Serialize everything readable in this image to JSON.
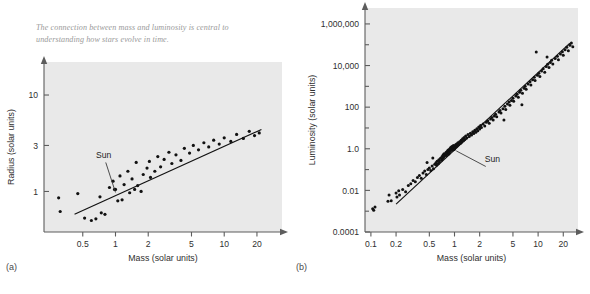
{
  "figure": {
    "caption": "The connection between mass and luminosity is central to understanding how stars evolve in time.",
    "background_color": "#ffffff",
    "plot_background_color": "#e9e9e9",
    "ink_color": "#111111",
    "axis_color": "#5d5d5d",
    "caption_color": "#9a9a9a"
  },
  "panels": {
    "a": {
      "label": "(a)"
    },
    "b": {
      "label": "(b)"
    }
  },
  "chart_data": [
    {
      "id": "radius-vs-mass",
      "panel": "(a)",
      "type": "scatter",
      "title": "",
      "xlabel": "Mass (solar units)",
      "ylabel": "Radius (solar units)",
      "xscale": "log",
      "yscale": "log",
      "xlim": [
        0.22,
        34
      ],
      "ylim": [
        0.38,
        22
      ],
      "grid": false,
      "legend": null,
      "xticks": [
        0.5,
        1,
        2,
        5,
        10,
        20
      ],
      "xticklabels": [
        "0.5",
        "1",
        "2",
        "5",
        "10",
        "20"
      ],
      "yticks": [
        1,
        3,
        10
      ],
      "yticklabels": [
        "1",
        "3",
        "10"
      ],
      "annotations": [
        {
          "text": "Sun",
          "x": 0.78,
          "y": 2.2,
          "points_to_x": 1.0,
          "points_to_y": 1.05
        }
      ],
      "fit_line": {
        "x": [
          0.42,
          22
        ],
        "y": [
          0.58,
          4.4
        ]
      },
      "points": [
        [
          0.3,
          0.86
        ],
        [
          0.31,
          0.62
        ],
        [
          0.45,
          0.95
        ],
        [
          0.52,
          0.53
        ],
        [
          0.6,
          0.5
        ],
        [
          0.66,
          0.52
        ],
        [
          0.72,
          0.88
        ],
        [
          0.74,
          0.6
        ],
        [
          0.8,
          0.58
        ],
        [
          0.88,
          1.1
        ],
        [
          0.95,
          1.28
        ],
        [
          0.98,
          1.05
        ],
        [
          1.0,
          1.05
        ],
        [
          1.05,
          0.8
        ],
        [
          1.1,
          1.45
        ],
        [
          1.15,
          0.82
        ],
        [
          1.2,
          1.18
        ],
        [
          1.3,
          1.62
        ],
        [
          1.35,
          0.97
        ],
        [
          1.42,
          1.35
        ],
        [
          1.5,
          1.05
        ],
        [
          1.55,
          2.0
        ],
        [
          1.6,
          1.15
        ],
        [
          1.72,
          1.0
        ],
        [
          1.8,
          1.5
        ],
        [
          1.95,
          1.75
        ],
        [
          2.05,
          2.05
        ],
        [
          2.1,
          1.4
        ],
        [
          2.3,
          1.62
        ],
        [
          2.45,
          2.3
        ],
        [
          2.6,
          1.8
        ],
        [
          2.8,
          2.15
        ],
        [
          3.1,
          2.55
        ],
        [
          3.3,
          1.95
        ],
        [
          3.6,
          2.4
        ],
        [
          4.0,
          2.1
        ],
        [
          4.3,
          2.8
        ],
        [
          4.8,
          2.5
        ],
        [
          5.2,
          3.0
        ],
        [
          5.8,
          2.7
        ],
        [
          6.5,
          3.2
        ],
        [
          7.2,
          2.9
        ],
        [
          8.0,
          3.4
        ],
        [
          9.0,
          3.1
        ],
        [
          10.0,
          3.6
        ],
        [
          11.5,
          3.3
        ],
        [
          13.0,
          3.9
        ],
        [
          15.0,
          3.55
        ],
        [
          17.0,
          4.2
        ],
        [
          19.0,
          3.8
        ],
        [
          21.0,
          4.05
        ]
      ]
    },
    {
      "id": "luminosity-vs-mass",
      "panel": "(b)",
      "type": "scatter",
      "title": "",
      "xlabel": "Mass (solar units)",
      "ylabel": "Luminosity (solar units)",
      "xscale": "log",
      "yscale": "log",
      "xlim": [
        0.085,
        30
      ],
      "ylim": [
        0.0001,
        3000000
      ],
      "grid": false,
      "legend": null,
      "xticks": [
        0.1,
        0.2,
        0.5,
        1,
        2,
        5,
        10,
        20
      ],
      "xticklabels": [
        "0.1",
        "0.2",
        "0.5",
        "1",
        "2",
        "5",
        "10",
        "20"
      ],
      "yticks": [
        0.0001,
        0.01,
        1.0,
        100,
        10000,
        1000000
      ],
      "yticklabels": [
        "0.0001",
        "0.01",
        "1.0",
        "100",
        "10,000",
        "1,000,000"
      ],
      "annotations": [
        {
          "text": "Sun",
          "x": 2.3,
          "y": 0.22,
          "points_to_x": 1.05,
          "points_to_y": 1.1
        }
      ],
      "fit_line": {
        "x": [
          0.2,
          24
        ],
        "y": [
          0.0022,
          120000
        ]
      },
      "points": [
        [
          0.105,
          0.0013
        ],
        [
          0.108,
          0.0011
        ],
        [
          0.112,
          0.0016
        ],
        [
          0.16,
          0.003
        ],
        [
          0.165,
          0.006
        ],
        [
          0.175,
          0.0032
        ],
        [
          0.2,
          0.0075
        ],
        [
          0.205,
          0.0048
        ],
        [
          0.215,
          0.0095
        ],
        [
          0.22,
          0.006
        ],
        [
          0.24,
          0.011
        ],
        [
          0.26,
          0.0085
        ],
        [
          0.28,
          0.017
        ],
        [
          0.3,
          0.021
        ],
        [
          0.32,
          0.03
        ],
        [
          0.34,
          0.026
        ],
        [
          0.36,
          0.042
        ],
        [
          0.38,
          0.052
        ],
        [
          0.4,
          0.038
        ],
        [
          0.42,
          0.068
        ],
        [
          0.44,
          0.085
        ],
        [
          0.46,
          0.058
        ],
        [
          0.48,
          0.1
        ],
        [
          0.5,
          0.12
        ],
        [
          0.52,
          0.09
        ],
        [
          0.54,
          0.15
        ],
        [
          0.56,
          0.11
        ],
        [
          0.58,
          0.18
        ],
        [
          0.6,
          0.21
        ],
        [
          0.61,
          0.16
        ],
        [
          0.62,
          0.25
        ],
        [
          0.64,
          0.19
        ],
        [
          0.65,
          0.3
        ],
        [
          0.66,
          0.23
        ],
        [
          0.68,
          0.35
        ],
        [
          0.7,
          0.28
        ],
        [
          0.71,
          0.42
        ],
        [
          0.72,
          0.33
        ],
        [
          0.73,
          0.5
        ],
        [
          0.74,
          0.38
        ],
        [
          0.75,
          0.58
        ],
        [
          0.76,
          0.45
        ],
        [
          0.78,
          0.52
        ],
        [
          0.79,
          0.66
        ],
        [
          0.8,
          0.48
        ],
        [
          0.81,
          0.72
        ],
        [
          0.82,
          0.6
        ],
        [
          0.83,
          0.82
        ],
        [
          0.84,
          0.55
        ],
        [
          0.85,
          0.9
        ],
        [
          0.86,
          0.7
        ],
        [
          0.87,
          0.62
        ],
        [
          0.88,
          1.0
        ],
        [
          0.89,
          0.78
        ],
        [
          0.9,
          1.15
        ],
        [
          0.91,
          0.85
        ],
        [
          0.92,
          0.95
        ],
        [
          0.93,
          1.3
        ],
        [
          0.94,
          1.05
        ],
        [
          0.95,
          0.88
        ],
        [
          0.96,
          1.2
        ],
        [
          0.97,
          1.45
        ],
        [
          0.98,
          1.1
        ],
        [
          0.99,
          0.92
        ],
        [
          1.0,
          1.0
        ],
        [
          1.01,
          1.35
        ],
        [
          1.02,
          1.18
        ],
        [
          1.03,
          1.55
        ],
        [
          1.05,
          1.25
        ],
        [
          1.06,
          1.7
        ],
        [
          1.08,
          1.4
        ],
        [
          1.1,
          1.95
        ],
        [
          1.12,
          1.6
        ],
        [
          1.15,
          2.2
        ],
        [
          1.18,
          1.85
        ],
        [
          1.2,
          2.6
        ],
        [
          1.22,
          2.1
        ],
        [
          1.25,
          3.0
        ],
        [
          1.28,
          2.45
        ],
        [
          1.3,
          3.5
        ],
        [
          1.33,
          2.8
        ],
        [
          1.36,
          4.1
        ],
        [
          1.4,
          3.3
        ],
        [
          1.45,
          4.8
        ],
        [
          1.5,
          3.9
        ],
        [
          1.55,
          5.6
        ],
        [
          1.6,
          4.6
        ],
        [
          1.65,
          6.5
        ],
        [
          1.7,
          5.4
        ],
        [
          1.75,
          7.8
        ],
        [
          1.8,
          6.2
        ],
        [
          1.85,
          9.2
        ],
        [
          1.9,
          7.4
        ],
        [
          1.95,
          11.0
        ],
        [
          2.0,
          8.8
        ],
        [
          2.05,
          13.0
        ],
        [
          2.1,
          10.5
        ],
        [
          2.2,
          15.5
        ],
        [
          2.3,
          12.5
        ],
        [
          2.4,
          19.0
        ],
        [
          2.5,
          22.0
        ],
        [
          2.6,
          17.0
        ],
        [
          2.7,
          27.0
        ],
        [
          2.8,
          32.0
        ],
        [
          2.9,
          24.0
        ],
        [
          3.0,
          38.0
        ],
        [
          3.1,
          46.0
        ],
        [
          3.2,
          35.0
        ],
        [
          3.4,
          58.0
        ],
        [
          3.5,
          70.0
        ],
        [
          3.6,
          52.0
        ],
        [
          3.8,
          85.0
        ],
        [
          4.0,
          110.0
        ],
        [
          4.1,
          78.0
        ],
        [
          4.3,
          140.0
        ],
        [
          4.5,
          175.0
        ],
        [
          4.6,
          125.0
        ],
        [
          4.8,
          210.0
        ],
        [
          5.0,
          270.0
        ],
        [
          5.1,
          190.0
        ],
        [
          5.4,
          340.0
        ],
        [
          5.6,
          420.0
        ],
        [
          5.8,
          300.0
        ],
        [
          6.0,
          520.0
        ],
        [
          6.2,
          650.0
        ],
        [
          6.5,
          470.0
        ],
        [
          6.8,
          800.0
        ],
        [
          7.0,
          1000.0
        ],
        [
          7.2,
          720.0
        ],
        [
          7.6,
          1300.0
        ],
        [
          8.0,
          1650.0
        ],
        [
          8.2,
          1150.0
        ],
        [
          8.6,
          2100.0
        ],
        [
          9.0,
          2700.0
        ],
        [
          9.2,
          1900.0
        ],
        [
          9.8,
          3400.0
        ],
        [
          10.2,
          4300.0
        ],
        [
          10.5,
          3000.0
        ],
        [
          11.0,
          5500.0
        ],
        [
          11.5,
          7000.0
        ],
        [
          12.0,
          4800.0
        ],
        [
          12.5,
          9000.0
        ],
        [
          13.0,
          11500.0
        ],
        [
          13.5,
          8000.0
        ],
        [
          14.0,
          14000.0
        ],
        [
          14.5,
          18000.0
        ],
        [
          15.0,
          12000.0
        ],
        [
          16.0,
          22000.0
        ],
        [
          17.0,
          28000.0
        ],
        [
          17.5,
          19000.0
        ],
        [
          18.5,
          36000.0
        ],
        [
          19.5,
          46000.0
        ],
        [
          20.0,
          31000.0
        ],
        [
          21.0,
          58000.0
        ],
        [
          22.0,
          75000.0
        ],
        [
          23.0,
          52000.0
        ],
        [
          24.0,
          95000.0
        ],
        [
          25.0,
          120000.0
        ],
        [
          26.0,
          80000.0
        ],
        [
          9.5,
          45000.0
        ],
        [
          12.8,
          26000.0
        ],
        [
          6.4,
          130.0
        ],
        [
          3.9,
          24.0
        ],
        [
          0.55,
          0.36
        ],
        [
          0.47,
          0.22
        ]
      ]
    }
  ]
}
